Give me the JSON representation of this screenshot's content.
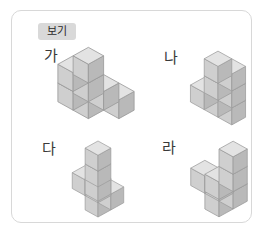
{
  "panel": {
    "tag_label": "보기",
    "background": "#ffffff",
    "border_color": "#d8d8d8",
    "tag_background": "#d9d9d9"
  },
  "cube_style": {
    "top_face": "#e3e3e3",
    "left_face": "#cfcfcf",
    "right_face": "#b9b9b9",
    "edge": "#9a9a9a"
  },
  "figures": [
    {
      "id": "ga",
      "label": "가",
      "description": "stair-step pyramid of cubes",
      "cube_count": 7,
      "cells": [
        {
          "x": 0,
          "y": 0,
          "z": 0
        },
        {
          "x": 1,
          "y": 0,
          "z": 0
        },
        {
          "x": 2,
          "y": 0,
          "z": 0
        },
        {
          "x": 0,
          "y": 1,
          "z": 0
        },
        {
          "x": 1,
          "y": 1,
          "z": 0
        },
        {
          "x": 0,
          "y": 0,
          "z": 1
        },
        {
          "x": 0,
          "y": 1,
          "z": 1
        }
      ]
    },
    {
      "id": "na",
      "label": "나",
      "description": "ascending staircase of three columns",
      "cube_count": 7,
      "cells": [
        {
          "x": 0,
          "y": 0,
          "z": 0
        },
        {
          "x": 1,
          "y": 0,
          "z": 0
        },
        {
          "x": 2,
          "y": 0,
          "z": 0
        },
        {
          "x": 1,
          "y": 0,
          "z": 1
        },
        {
          "x": 2,
          "y": 0,
          "z": 1
        },
        {
          "x": 1,
          "y": 0,
          "z": 2
        },
        {
          "x": 2,
          "y": 0,
          "z": 2
        }
      ]
    },
    {
      "id": "da",
      "label": "다",
      "description": "L shaped base with tall rear column",
      "cube_count": 7,
      "cells": [
        {
          "x": 0,
          "y": 0,
          "z": 0
        },
        {
          "x": 1,
          "y": 0,
          "z": 0
        },
        {
          "x": 2,
          "y": 0,
          "z": 0
        },
        {
          "x": 2,
          "y": 1,
          "z": 0
        },
        {
          "x": 1,
          "y": 0,
          "z": 1
        },
        {
          "x": 2,
          "y": 1,
          "z": 1
        },
        {
          "x": 1,
          "y": 0,
          "z": 2
        }
      ]
    },
    {
      "id": "ra",
      "label": "라",
      "description": "T shaped base with tall centre column",
      "cube_count": 7,
      "cells": [
        {
          "x": 0,
          "y": 0,
          "z": 0
        },
        {
          "x": 1,
          "y": 0,
          "z": 0
        },
        {
          "x": 2,
          "y": 0,
          "z": 0
        },
        {
          "x": 2,
          "y": 1,
          "z": 0
        },
        {
          "x": 2,
          "y": 0,
          "z": 1
        },
        {
          "x": 2,
          "y": 1,
          "z": 1
        },
        {
          "x": 2,
          "y": 0,
          "z": 2
        }
      ]
    }
  ]
}
